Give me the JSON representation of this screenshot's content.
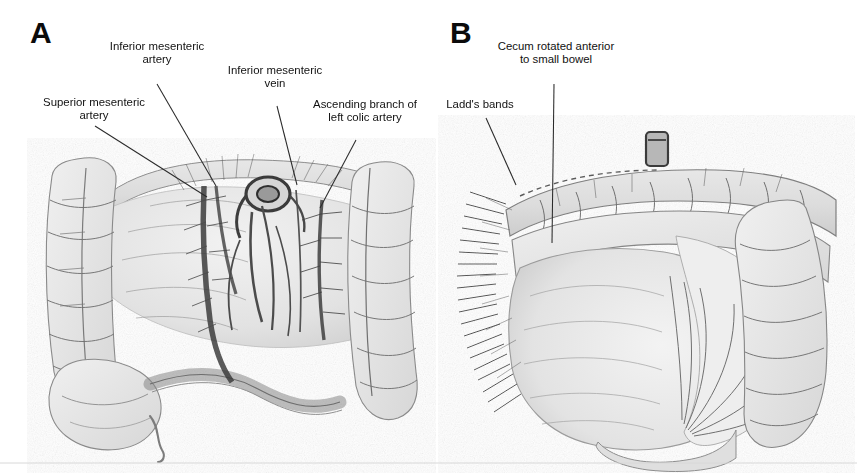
{
  "figure": {
    "background_color": "#ffffff",
    "ink_color": "#111111",
    "style": "grayscale halftone pen-and-ink medical illustration"
  },
  "panels": [
    {
      "id": "A",
      "letter": "A",
      "subject": "Colon and mesenteric vessels with narrow mesenteric base (malrotation)",
      "labels": [
        {
          "name": "superior-mesenteric-artery",
          "text": "Superior mesenteric\nartery",
          "x": 14,
          "y": 96,
          "width": 160,
          "leader": {
            "x1": 95,
            "y1": 126,
            "x2": 207,
            "y2": 197
          }
        },
        {
          "name": "inferior-mesenteric-artery",
          "text": "Inferior mesenteric\nartery",
          "x": 95,
          "y": 40,
          "width": 124,
          "leader": {
            "x1": 157,
            "y1": 84,
            "x2": 216,
            "y2": 186
          }
        },
        {
          "name": "inferior-mesenteric-vein",
          "text": "Inferior mesenteric\nvein",
          "x": 213,
          "y": 64,
          "width": 124,
          "leader": {
            "x1": 277,
            "y1": 106,
            "x2": 297,
            "y2": 185
          }
        },
        {
          "name": "ascending-branch-left-colic-artery",
          "text": "Ascending branch of\nleft colic artery",
          "x": 297,
          "y": 98,
          "width": 136,
          "leader": {
            "x1": 356,
            "y1": 140,
            "x2": 320,
            "y2": 208
          }
        }
      ]
    },
    {
      "id": "B",
      "letter": "B",
      "subject": "Cecum rotated anterior to small bowel with Ladd's bands",
      "labels": [
        {
          "name": "cecum-rotated-anterior-to-small-bowel",
          "text": "Cecum rotated anterior\nto small bowel",
          "x": 483,
          "y": 40,
          "width": 146,
          "leader": {
            "x1": 554,
            "y1": 84,
            "x2": 552,
            "y2": 243
          }
        },
        {
          "name": "ladds-bands",
          "text": "Ladd's bands",
          "x": 432,
          "y": 98,
          "width": 96,
          "leader": {
            "x1": 486,
            "y1": 118,
            "x2": 516,
            "y2": 185
          }
        }
      ]
    }
  ],
  "panel_letters": [
    {
      "name": "panel-letter-a",
      "value": "A",
      "x": 30,
      "y": 18
    },
    {
      "name": "panel-letter-b",
      "value": "B",
      "x": 450,
      "y": 18
    }
  ]
}
